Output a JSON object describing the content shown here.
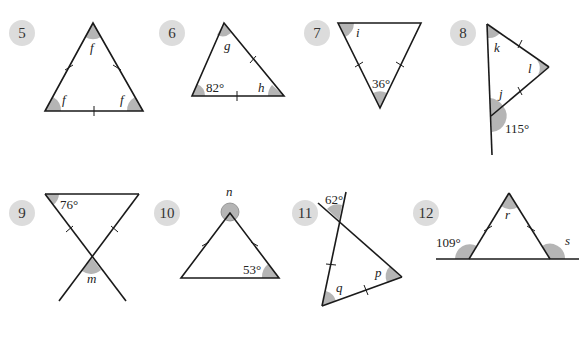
{
  "colors": {
    "line": "#1a1a1a",
    "angle_fill": "#b5b5b5",
    "badge": "#dcdcdc"
  },
  "questions": [
    {
      "number": "5",
      "labels": [
        "f",
        "f",
        "f"
      ]
    },
    {
      "number": "6",
      "labels": [
        "g",
        "82°",
        "h"
      ]
    },
    {
      "number": "7",
      "labels": [
        "i",
        "36°"
      ]
    },
    {
      "number": "8",
      "labels": [
        "k",
        "l",
        "j",
        "115°"
      ]
    },
    {
      "number": "9",
      "labels": [
        "76°",
        "m"
      ]
    },
    {
      "number": "10",
      "labels": [
        "n",
        "53°"
      ]
    },
    {
      "number": "11",
      "labels": [
        "62°",
        "p",
        "q"
      ]
    },
    {
      "number": "12",
      "labels": [
        "r",
        "109°",
        "s"
      ]
    }
  ]
}
